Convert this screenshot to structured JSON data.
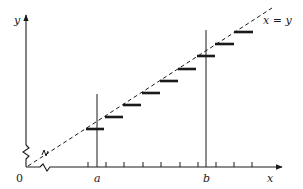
{
  "diagram": {
    "type": "staircase-step-function-vs-identity-line",
    "labels": {
      "y_axis": "y",
      "x_axis": "x",
      "origin": "0",
      "a": "a",
      "b": "b",
      "identity_line": "x = y"
    },
    "colors": {
      "ink": "#1a1a1a",
      "background": "#ffffff"
    },
    "axes": {
      "origin_px": [
        26,
        167
      ],
      "y_axis_top_px": 14,
      "x_axis_right_px": 282,
      "axis_breaks": [
        "y-axis break near origin",
        "x-axis break near origin"
      ]
    },
    "x_ticks_px": [
      88,
      106,
      124,
      143,
      161,
      180,
      198,
      216,
      234,
      252
    ],
    "verticals_px": [
      {
        "name": "a",
        "x": 97,
        "y_top": 94
      },
      {
        "name": "b",
        "x": 206,
        "y_top": 30
      }
    ],
    "dashed_line_px": {
      "x1": 28,
      "y1": 166,
      "x2": 272,
      "y2": 8
    },
    "steps_px": [
      {
        "x1": 86,
        "x2": 104,
        "y": 129
      },
      {
        "x1": 105,
        "x2": 123,
        "y": 117
      },
      {
        "x1": 123,
        "x2": 141,
        "y": 105
      },
      {
        "x1": 142,
        "x2": 160,
        "y": 93
      },
      {
        "x1": 160,
        "x2": 178,
        "y": 81
      },
      {
        "x1": 178,
        "x2": 196,
        "y": 69
      },
      {
        "x1": 197,
        "x2": 215,
        "y": 56
      },
      {
        "x1": 215,
        "x2": 234,
        "y": 44
      },
      {
        "x1": 234,
        "x2": 253,
        "y": 32
      }
    ]
  }
}
